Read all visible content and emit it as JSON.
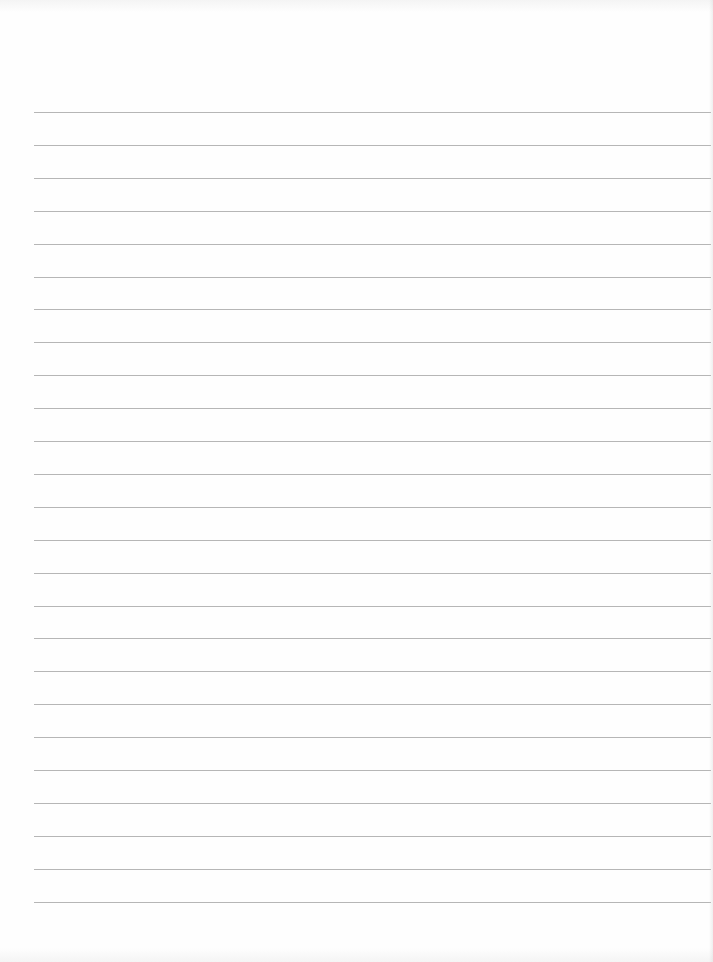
{
  "page": {
    "type": "blank lined paper",
    "background_color": "#fefefe",
    "line_color": "#a9a9a9",
    "line_count": 25,
    "first_line_y": 112,
    "line_spacing": 32.9,
    "line_left_x": 34,
    "line_width": 677,
    "text_content": ""
  }
}
